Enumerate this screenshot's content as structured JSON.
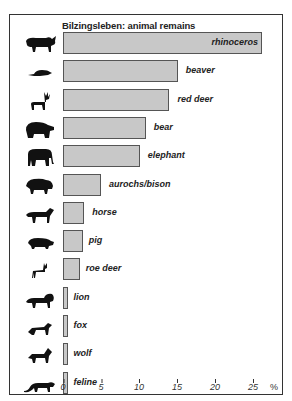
{
  "chart_data": {
    "type": "bar",
    "orientation": "horizontal",
    "title": "Bilzingsleben: animal remains",
    "xlabel": "%",
    "ylabel": "",
    "xlim": [
      0,
      27
    ],
    "xticks": [
      0,
      5,
      10,
      15,
      20,
      25
    ],
    "grid": false,
    "categories": [
      "rhinoceros",
      "beaver",
      "red deer",
      "bear",
      "elephant",
      "aurochs/bison",
      "horse",
      "pig",
      "roe deer",
      "lion",
      "fox",
      "wolf",
      "feline"
    ],
    "values": [
      26.2,
      15.1,
      14.0,
      10.9,
      10.1,
      5.0,
      2.8,
      2.6,
      2.2,
      0.6,
      0.6,
      0.6,
      0.6
    ],
    "icons": [
      "rhinoceros-icon",
      "beaver-icon",
      "red-deer-icon",
      "bear-icon",
      "elephant-icon",
      "bison-icon",
      "horse-icon",
      "pig-icon",
      "roe-deer-icon",
      "lion-icon",
      "fox-icon",
      "wolf-icon",
      "feline-icon"
    ]
  },
  "colors": {
    "bar_fill": "#c8c8c8",
    "bar_border": "#555555",
    "silhouette": "#111111"
  },
  "axis": {
    "unit": "%",
    "ticks": [
      "0",
      "5",
      "10",
      "15",
      "20",
      "25"
    ]
  }
}
